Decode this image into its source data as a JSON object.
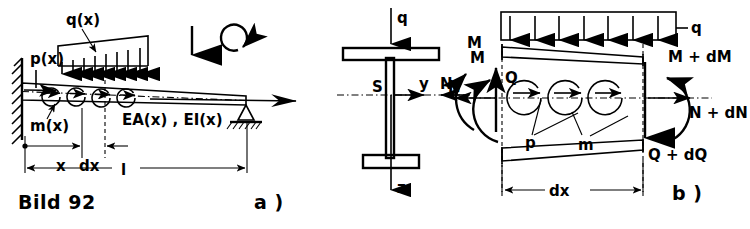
{
  "figure": {
    "caption": "Bild 92",
    "panel_a_label": "a )",
    "panel_b_label": "b )"
  },
  "panel_a": {
    "name": "cantilever-beam-with-distributed-loads",
    "labels": {
      "q": "q(x)",
      "p": "p(x)",
      "m": "m(x)",
      "stiffness": "EA(x) , EI(x)",
      "dim_x": "x",
      "dim_dx": "dx",
      "dim_l": "l"
    },
    "icons": {
      "fixed_support": "hatched-wall-icon",
      "pin_support": "triangle-pin-support-icon",
      "ground_hatch": "hatched-ground-icon",
      "sign_force": "down-arrow-icon",
      "sign_moment": "clockwise-rotation-icon"
    },
    "load_arrow_count": 8,
    "axial_arrow_count": 4
  },
  "panel_cross_section": {
    "name": "i-beam-cross-section",
    "labels": {
      "q": "q",
      "centroid": "S",
      "y_axis": "y",
      "z_axis": "z",
      "normal_force": "N",
      "moment": "M"
    }
  },
  "panel_b": {
    "name": "differential-beam-element-equilibrium",
    "labels": {
      "q": "q",
      "M_left": "M",
      "N_left": "N",
      "Q_left": "Q",
      "M_right": "M + dM",
      "N_right": "N + dN",
      "Q_right": "Q + dQ",
      "p": "p",
      "m": "m",
      "dim_dx": "dx"
    },
    "load_arrow_count": 7,
    "internal_arrow_count": 3
  }
}
